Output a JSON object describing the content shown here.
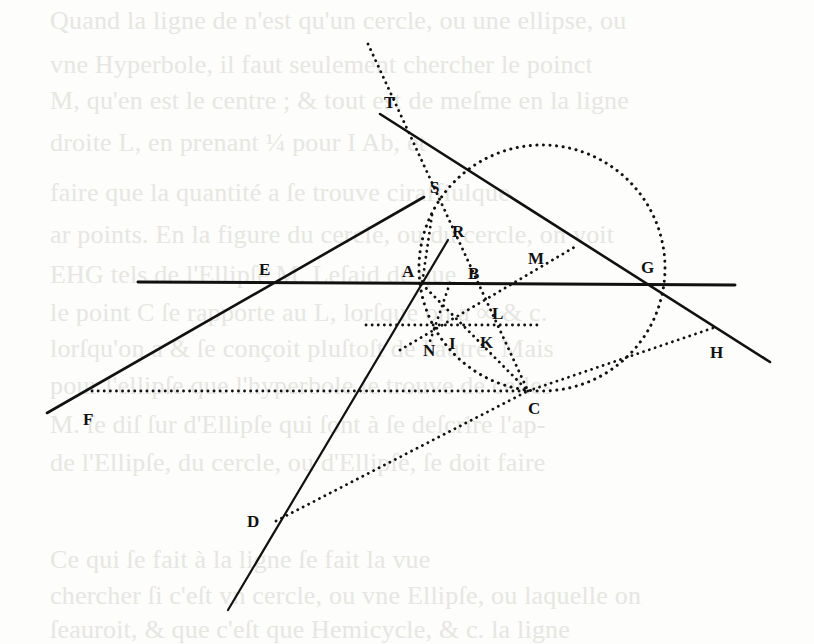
{
  "page": {
    "background": "#fdfdfb",
    "ink": "#111111",
    "bleed_color": "#e6e6e2"
  },
  "bleed_through_text": [
    {
      "y": 8,
      "text": "Quand la ligne de n'est qu'un cercle, ou une ellipse, ou"
    },
    {
      "y": 52,
      "text": "vne Hyperbole, il faut seulement chercher le poinct"
    },
    {
      "y": 88,
      "text": "M, qu'en est le centre ; & tout est de meſme en la ligne"
    },
    {
      "y": 130,
      "text": "droite L, en prenant ¼ pour I Ab, et"
    },
    {
      "y": 180,
      "text": "faire que la quantité a ſe trouve ciraffiulque"
    },
    {
      "y": 222,
      "text": "ar points. En la figure du cercle, ou du cercle, on voit"
    },
    {
      "y": 262,
      "text": "EHG tels de l'Ellipſe M. Leſaid de que"
    },
    {
      "y": 300,
      "text": "le point C ſe rapporte au L, lorſque on a ∞ & c."
    },
    {
      "y": 336,
      "text": "lorſqu'on a & ſe conçoit pluſtoſt de l'autre. Mais"
    },
    {
      "y": 373,
      "text": "pour l'ellipſe que l'hyperbole ſe trouve de celles"
    },
    {
      "y": 412,
      "text": "M. ſe diſ ſur d'Ellipſe qui ſont à ſe deſcrire l'ap-"
    },
    {
      "y": 450,
      "text": "de l'Ellipſe, du cercle, ou d'Ellipſe, ſe doit faire"
    },
    {
      "y": 547,
      "text": "Ce qui ſe fait à la ligne ſe fait la vue"
    },
    {
      "y": 583,
      "text": "chercher ſi c'eſt vn cercle, ou vne Ellipſe, ou laquelle on"
    },
    {
      "y": 617,
      "text": "ſeauroit, & que c'eſt que Hemicycle,  & c. la ligne"
    }
  ],
  "figure": {
    "labels": [
      {
        "id": "T",
        "text": "T",
        "x": 384,
        "y": 108
      },
      {
        "id": "S",
        "text": "S",
        "x": 430,
        "y": 193
      },
      {
        "id": "R",
        "text": "R",
        "x": 452,
        "y": 237
      },
      {
        "id": "E",
        "text": "E",
        "x": 259,
        "y": 275
      },
      {
        "id": "A",
        "text": "A",
        "x": 402,
        "y": 277
      },
      {
        "id": "B",
        "text": "B",
        "x": 468,
        "y": 279
      },
      {
        "id": "M",
        "text": "M",
        "x": 528,
        "y": 264
      },
      {
        "id": "G",
        "text": "G",
        "x": 641,
        "y": 273
      },
      {
        "id": "L",
        "text": "L",
        "x": 492,
        "y": 319
      },
      {
        "id": "N",
        "text": "N",
        "x": 423,
        "y": 356
      },
      {
        "id": "I",
        "text": "I",
        "x": 449,
        "y": 349
      },
      {
        "id": "K",
        "text": "K",
        "x": 480,
        "y": 348
      },
      {
        "id": "H",
        "text": "H",
        "x": 710,
        "y": 358
      },
      {
        "id": "F",
        "text": "F",
        "x": 83,
        "y": 425
      },
      {
        "id": "C",
        "text": "C",
        "x": 528,
        "y": 414
      },
      {
        "id": "D",
        "text": "D",
        "x": 247,
        "y": 527
      }
    ],
    "circle": {
      "cx": 542,
      "cy": 268,
      "r": 123
    }
  }
}
